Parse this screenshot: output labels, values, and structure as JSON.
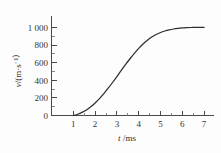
{
  "chart_data": {
    "type": "line",
    "title": "",
    "subtitle": "",
    "xlabel": "t /ms",
    "xlabel_symbol": "t",
    "xlabel_unit": "/ms",
    "ylabel": "v/(m·s⁻¹)",
    "ylabel_symbol": "v",
    "ylabel_unit": "/(m·s⁻¹)",
    "xlim": [
      0,
      7.4
    ],
    "ylim": [
      0,
      1100
    ],
    "grid": false,
    "legend": false,
    "legend_position": "none",
    "x_ticks": [
      1,
      2,
      3,
      4,
      5,
      6,
      7
    ],
    "x_tick_labels": [
      "1",
      "2",
      "3",
      "4",
      "5",
      "6",
      "7"
    ],
    "x_minor_ticks": [
      0.5,
      1.5,
      2.5,
      3.5,
      4.5,
      5.5,
      6.5
    ],
    "y_ticks": [
      0,
      200,
      400,
      600,
      800,
      1000
    ],
    "y_tick_labels": [
      "0",
      "200",
      "400",
      "600",
      "800",
      "1 000"
    ],
    "y_minor_ticks": [
      100,
      300,
      500,
      700,
      900
    ],
    "origin_label": "0",
    "series": [
      {
        "name": "velocity",
        "color": "#2e2e2e",
        "x": [
          1.0,
          1.2,
          1.4,
          1.6,
          1.8,
          2.0,
          2.2,
          2.4,
          2.6,
          2.8,
          3.0,
          3.2,
          3.4,
          3.6,
          3.8,
          4.0,
          4.2,
          4.4,
          4.6,
          4.8,
          5.0,
          5.2,
          5.4,
          5.6,
          5.8,
          6.0,
          6.2,
          6.4,
          6.6,
          6.8,
          7.0
        ],
        "values": [
          0,
          14,
          35,
          63,
          99,
          142,
          192,
          249,
          310,
          375,
          443,
          512,
          580,
          645,
          706,
          762,
          812,
          855,
          891,
          920,
          943,
          960,
          973,
          983,
          990,
          995,
          998,
          1000,
          1001,
          1002,
          1002
        ]
      }
    ],
    "annotations": []
  },
  "figure": {
    "name": "velocity-time-graph",
    "background_color": "#fdfdfd",
    "axis_color": "#4a4a4a",
    "curve_color": "#2e2e2e"
  }
}
